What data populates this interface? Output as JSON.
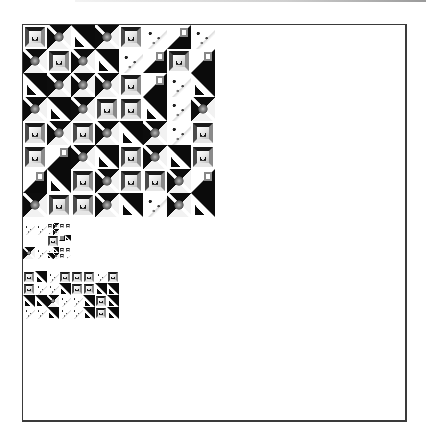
{
  "colors": {
    "frame": "#3a3a3a",
    "background": "#ffffff",
    "ink": "#0d0d0d"
  },
  "canvas": {
    "left": 22,
    "top": 24,
    "width": 382,
    "height": 395
  },
  "mosaic": {
    "tiles": [
      {
        "x": 0,
        "y": 0,
        "s": 24,
        "t": "frame"
      },
      {
        "x": 24,
        "y": 0,
        "s": 24,
        "t": "dark"
      },
      {
        "x": 48,
        "y": 0,
        "s": 24,
        "t": "split"
      },
      {
        "x": 72,
        "y": 0,
        "s": 24,
        "t": "dark"
      },
      {
        "x": 96,
        "y": 0,
        "s": 24,
        "t": "frame"
      },
      {
        "x": 120,
        "y": 0,
        "s": 24,
        "t": "light"
      },
      {
        "x": 144,
        "y": 0,
        "s": 24,
        "t": "splitr"
      },
      {
        "x": 168,
        "y": 0,
        "s": 24,
        "t": "light"
      },
      {
        "x": 0,
        "y": 24,
        "s": 24,
        "t": "dark"
      },
      {
        "x": 24,
        "y": 24,
        "s": 24,
        "t": "frame"
      },
      {
        "x": 48,
        "y": 24,
        "s": 24,
        "t": "dark"
      },
      {
        "x": 72,
        "y": 24,
        "s": 24,
        "t": "split"
      },
      {
        "x": 96,
        "y": 24,
        "s": 24,
        "t": "light"
      },
      {
        "x": 120,
        "y": 24,
        "s": 24,
        "t": "splitr"
      },
      {
        "x": 144,
        "y": 24,
        "s": 24,
        "t": "frame"
      },
      {
        "x": 168,
        "y": 24,
        "s": 24,
        "t": "splitr"
      },
      {
        "x": 0,
        "y": 48,
        "s": 24,
        "t": "split"
      },
      {
        "x": 24,
        "y": 48,
        "s": 24,
        "t": "dark"
      },
      {
        "x": 48,
        "y": 48,
        "s": 24,
        "t": "dark"
      },
      {
        "x": 72,
        "y": 48,
        "s": 24,
        "t": "dark"
      },
      {
        "x": 96,
        "y": 48,
        "s": 24,
        "t": "frame"
      },
      {
        "x": 120,
        "y": 48,
        "s": 24,
        "t": "splitr"
      },
      {
        "x": 144,
        "y": 48,
        "s": 24,
        "t": "light"
      },
      {
        "x": 168,
        "y": 48,
        "s": 24,
        "t": "split"
      },
      {
        "x": 0,
        "y": 72,
        "s": 24,
        "t": "dark"
      },
      {
        "x": 24,
        "y": 72,
        "s": 24,
        "t": "split"
      },
      {
        "x": 48,
        "y": 72,
        "s": 24,
        "t": "dark"
      },
      {
        "x": 72,
        "y": 72,
        "s": 24,
        "t": "frame"
      },
      {
        "x": 96,
        "y": 72,
        "s": 24,
        "t": "frame"
      },
      {
        "x": 120,
        "y": 72,
        "s": 24,
        "t": "split"
      },
      {
        "x": 144,
        "y": 72,
        "s": 24,
        "t": "light"
      },
      {
        "x": 168,
        "y": 72,
        "s": 24,
        "t": "dark"
      },
      {
        "x": 0,
        "y": 96,
        "s": 24,
        "t": "frame"
      },
      {
        "x": 24,
        "y": 96,
        "s": 24,
        "t": "dark"
      },
      {
        "x": 48,
        "y": 96,
        "s": 24,
        "t": "frame"
      },
      {
        "x": 72,
        "y": 96,
        "s": 24,
        "t": "dark"
      },
      {
        "x": 96,
        "y": 96,
        "s": 24,
        "t": "split"
      },
      {
        "x": 120,
        "y": 96,
        "s": 24,
        "t": "dark"
      },
      {
        "x": 144,
        "y": 96,
        "s": 24,
        "t": "light"
      },
      {
        "x": 168,
        "y": 96,
        "s": 24,
        "t": "frame"
      },
      {
        "x": 0,
        "y": 120,
        "s": 24,
        "t": "frame"
      },
      {
        "x": 24,
        "y": 120,
        "s": 24,
        "t": "splitr"
      },
      {
        "x": 48,
        "y": 120,
        "s": 24,
        "t": "dark"
      },
      {
        "x": 72,
        "y": 120,
        "s": 24,
        "t": "split"
      },
      {
        "x": 96,
        "y": 120,
        "s": 24,
        "t": "frame"
      },
      {
        "x": 120,
        "y": 120,
        "s": 24,
        "t": "dark"
      },
      {
        "x": 144,
        "y": 120,
        "s": 24,
        "t": "split"
      },
      {
        "x": 168,
        "y": 120,
        "s": 24,
        "t": "frame"
      },
      {
        "x": 0,
        "y": 144,
        "s": 24,
        "t": "splitr"
      },
      {
        "x": 24,
        "y": 144,
        "s": 24,
        "t": "split"
      },
      {
        "x": 48,
        "y": 144,
        "s": 24,
        "t": "frame"
      },
      {
        "x": 72,
        "y": 144,
        "s": 24,
        "t": "dark"
      },
      {
        "x": 96,
        "y": 144,
        "s": 24,
        "t": "frame"
      },
      {
        "x": 120,
        "y": 144,
        "s": 24,
        "t": "frame"
      },
      {
        "x": 144,
        "y": 144,
        "s": 24,
        "t": "dark"
      },
      {
        "x": 168,
        "y": 144,
        "s": 24,
        "t": "splitr"
      },
      {
        "x": 0,
        "y": 168,
        "s": 24,
        "t": "dark"
      },
      {
        "x": 24,
        "y": 168,
        "s": 24,
        "t": "frame"
      },
      {
        "x": 48,
        "y": 168,
        "s": 24,
        "t": "frame"
      },
      {
        "x": 72,
        "y": 168,
        "s": 24,
        "t": "dark"
      },
      {
        "x": 96,
        "y": 168,
        "s": 24,
        "t": "split"
      },
      {
        "x": 120,
        "y": 168,
        "s": 24,
        "t": "light"
      },
      {
        "x": 144,
        "y": 168,
        "s": 24,
        "t": "dark"
      },
      {
        "x": 168,
        "y": 168,
        "s": 24,
        "t": "split"
      },
      {
        "x": 0,
        "y": 198,
        "s": 12,
        "t": "light"
      },
      {
        "x": 12,
        "y": 198,
        "s": 12,
        "t": "light"
      },
      {
        "x": 24,
        "y": 198,
        "s": 6,
        "t": "frame"
      },
      {
        "x": 30,
        "y": 198,
        "s": 6,
        "t": "dark"
      },
      {
        "x": 24,
        "y": 204,
        "s": 6,
        "t": "light"
      },
      {
        "x": 30,
        "y": 204,
        "s": 6,
        "t": "dark"
      },
      {
        "x": 36,
        "y": 198,
        "s": 6,
        "t": "frame"
      },
      {
        "x": 42,
        "y": 198,
        "s": 6,
        "t": "frame"
      },
      {
        "x": 24,
        "y": 210,
        "s": 12,
        "t": "frame"
      },
      {
        "x": 36,
        "y": 210,
        "s": 6,
        "t": "splitr"
      },
      {
        "x": 42,
        "y": 210,
        "s": 6,
        "t": "split"
      },
      {
        "x": 0,
        "y": 222,
        "s": 12,
        "t": "dark"
      },
      {
        "x": 12,
        "y": 222,
        "s": 12,
        "t": "light"
      },
      {
        "x": 24,
        "y": 222,
        "s": 6,
        "t": "light"
      },
      {
        "x": 30,
        "y": 222,
        "s": 6,
        "t": "split"
      },
      {
        "x": 36,
        "y": 222,
        "s": 6,
        "t": "frame"
      },
      {
        "x": 42,
        "y": 222,
        "s": 6,
        "t": "frame"
      },
      {
        "x": 24,
        "y": 228,
        "s": 6,
        "t": "split"
      },
      {
        "x": 30,
        "y": 228,
        "s": 6,
        "t": "dark"
      },
      {
        "x": 36,
        "y": 228,
        "s": 6,
        "t": "frame"
      },
      {
        "x": 42,
        "y": 228,
        "s": 6,
        "t": "light"
      },
      {
        "x": 0,
        "y": 246,
        "s": 12,
        "t": "frame"
      },
      {
        "x": 12,
        "y": 246,
        "s": 12,
        "t": "split"
      },
      {
        "x": 24,
        "y": 246,
        "s": 12,
        "t": "light"
      },
      {
        "x": 36,
        "y": 246,
        "s": 12,
        "t": "frame"
      },
      {
        "x": 48,
        "y": 246,
        "s": 12,
        "t": "frame"
      },
      {
        "x": 60,
        "y": 246,
        "s": 12,
        "t": "frame"
      },
      {
        "x": 72,
        "y": 246,
        "s": 12,
        "t": "light"
      },
      {
        "x": 84,
        "y": 246,
        "s": 12,
        "t": "frame"
      },
      {
        "x": 0,
        "y": 258,
        "s": 12,
        "t": "frame"
      },
      {
        "x": 12,
        "y": 258,
        "s": 12,
        "t": "light"
      },
      {
        "x": 24,
        "y": 258,
        "s": 12,
        "t": "light"
      },
      {
        "x": 36,
        "y": 258,
        "s": 12,
        "t": "split"
      },
      {
        "x": 48,
        "y": 258,
        "s": 12,
        "t": "frame"
      },
      {
        "x": 60,
        "y": 258,
        "s": 12,
        "t": "frame"
      },
      {
        "x": 72,
        "y": 258,
        "s": 12,
        "t": "split"
      },
      {
        "x": 84,
        "y": 258,
        "s": 12,
        "t": "split"
      },
      {
        "x": 0,
        "y": 270,
        "s": 12,
        "t": "split"
      },
      {
        "x": 12,
        "y": 270,
        "s": 12,
        "t": "split"
      },
      {
        "x": 24,
        "y": 270,
        "s": 12,
        "t": "dark"
      },
      {
        "x": 36,
        "y": 270,
        "s": 12,
        "t": "light"
      },
      {
        "x": 48,
        "y": 270,
        "s": 12,
        "t": "light"
      },
      {
        "x": 60,
        "y": 270,
        "s": 12,
        "t": "split"
      },
      {
        "x": 72,
        "y": 270,
        "s": 12,
        "t": "frame"
      },
      {
        "x": 84,
        "y": 270,
        "s": 12,
        "t": "split"
      },
      {
        "x": 0,
        "y": 282,
        "s": 12,
        "t": "light"
      },
      {
        "x": 12,
        "y": 282,
        "s": 12,
        "t": "light"
      },
      {
        "x": 24,
        "y": 282,
        "s": 12,
        "t": "split"
      },
      {
        "x": 36,
        "y": 282,
        "s": 12,
        "t": "light"
      },
      {
        "x": 48,
        "y": 282,
        "s": 12,
        "t": "light"
      },
      {
        "x": 60,
        "y": 282,
        "s": 12,
        "t": "split"
      },
      {
        "x": 72,
        "y": 282,
        "s": 12,
        "t": "frame"
      },
      {
        "x": 84,
        "y": 282,
        "s": 12,
        "t": "split"
      }
    ]
  }
}
